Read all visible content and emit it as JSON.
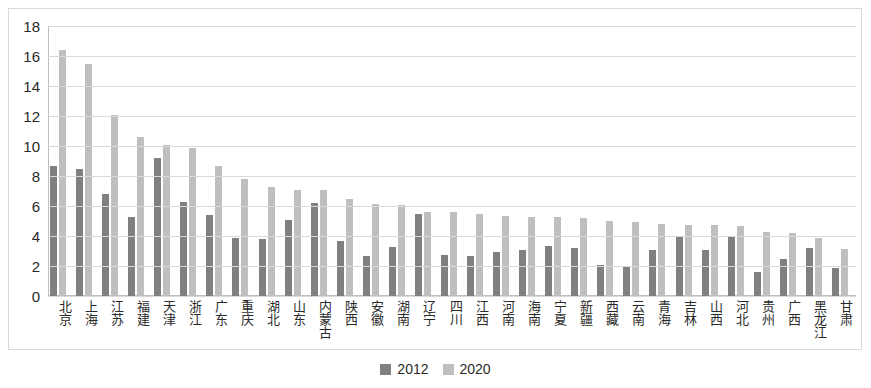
{
  "chart_data": {
    "type": "bar",
    "title": "",
    "subtitle": "",
    "xlabel": "",
    "ylabel": "",
    "ylim": [
      0,
      18
    ],
    "ytick_step": 2,
    "yticks": [
      "18",
      "16",
      "14",
      "12",
      "10",
      "8",
      "6",
      "4",
      "2",
      "0"
    ],
    "grid": true,
    "legend_position": "bottom-center",
    "categories": [
      "北京",
      "上海",
      "江苏",
      "福建",
      "天津",
      "浙江",
      "广东",
      "重庆",
      "湖北",
      "山东",
      "内蒙古",
      "陕西",
      "安徽",
      "湖南",
      "辽宁",
      "四川",
      "江西",
      "河南",
      "海南",
      "宁夏",
      "新疆",
      "西藏",
      "云南",
      "青海",
      "吉林",
      "山西",
      "河北",
      "贵州",
      "广西",
      "黑龙江",
      "甘肃"
    ],
    "series": [
      {
        "name": "2012",
        "color": "#808080",
        "values": [
          8.7,
          8.5,
          6.8,
          5.3,
          9.2,
          6.3,
          5.4,
          3.9,
          3.8,
          5.1,
          6.2,
          3.7,
          2.7,
          3.3,
          5.5,
          2.75,
          2.7,
          2.95,
          3.05,
          3.35,
          3.2,
          2.1,
          1.95,
          3.05,
          4.0,
          3.05,
          4.0,
          1.6,
          2.5,
          3.2,
          1.85
        ]
      },
      {
        "name": "2020",
        "color": "#bfbfbf",
        "values": [
          16.4,
          15.5,
          12.1,
          10.6,
          10.1,
          9.9,
          8.7,
          7.8,
          7.3,
          7.1,
          7.05,
          6.45,
          6.15,
          6.1,
          5.6,
          5.6,
          5.5,
          5.35,
          5.3,
          5.25,
          5.2,
          5.0,
          4.95,
          4.8,
          4.75,
          4.75,
          4.65,
          4.3,
          4.2,
          3.85,
          3.15
        ]
      }
    ]
  },
  "legend": {
    "items": [
      {
        "label": "2012",
        "color": "#808080"
      },
      {
        "label": "2020",
        "color": "#bfbfbf"
      }
    ]
  },
  "colors": {
    "series_2012": "#808080",
    "series_2020": "#bfbfbf",
    "gridline": "#d9d9d9",
    "frame": "#d9d9d9",
    "text": "#2a2a2a",
    "background": "#ffffff"
  }
}
